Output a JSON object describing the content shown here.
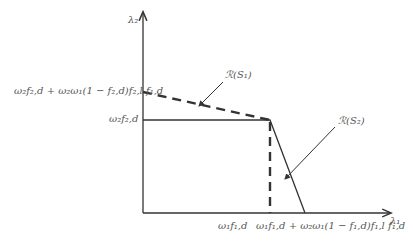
{
  "diagram": {
    "axes": {
      "y_label": "λ₂",
      "x_label": "λ₁"
    },
    "y_ticks": [
      {
        "label": "ω₂f₂,d + ω₂ω₁(1 − f₂,d)f₂,l f₁,d"
      },
      {
        "label": "ω₂f₂,d"
      }
    ],
    "x_ticks": [
      {
        "label": "ω₁f₁,d"
      },
      {
        "label": "ω₁f₁,d + ω₂ω₁(1 − f₁,d)f₁,l f₁,d"
      }
    ],
    "regions": [
      {
        "label": "ℛ(S₁)",
        "style": "dashed"
      },
      {
        "label": "ℛ(S₂)",
        "style": "solid"
      }
    ],
    "colors": {
      "line": "#333333",
      "text": "#555555"
    }
  }
}
